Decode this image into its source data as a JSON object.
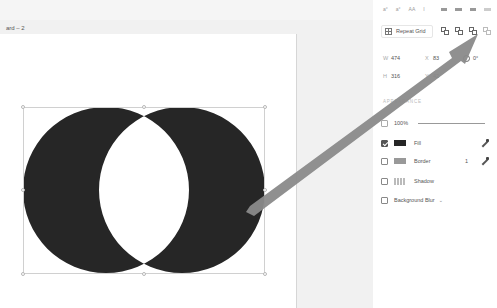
{
  "canvas": {
    "artboard_label": "ard – 2",
    "shape": {
      "type": "exclude-overlap boolean of two circles",
      "fill": "#262626"
    }
  },
  "toolbar": {
    "items": [
      "text-size-icon",
      "text-size-icon",
      "text-case-icon",
      "text-style-icon"
    ],
    "align_items": [
      "align-left-icon",
      "align-center-icon",
      "align-right-icon",
      "align-justify-icon"
    ]
  },
  "panel": {
    "repeat_grid_label": "Repeat Grid",
    "boolean_icons": [
      "union-icon",
      "subtract-icon",
      "intersect-icon",
      "exclude-overlap-icon"
    ],
    "properties": {
      "w_label": "W",
      "w_value": "474",
      "x_label": "X",
      "x_value": "83",
      "h_label": "H",
      "h_value": "316",
      "y_label": "Y",
      "y_value": "42",
      "rotation_value": "0°"
    },
    "appearance": {
      "title": "APPEARANCE",
      "opacity": "100%",
      "fill_label": "Fill",
      "fill_color": "#262626",
      "fill_checked": true,
      "border_label": "Border",
      "border_color": "#999999",
      "border_width": "1",
      "border_checked": false,
      "shadow_label": "Shadow",
      "shadow_checked": false,
      "background_blur_label": "Background Blur",
      "background_blur_checked": false
    }
  },
  "annotation": {
    "arrow_color": "#8a8a8a"
  }
}
